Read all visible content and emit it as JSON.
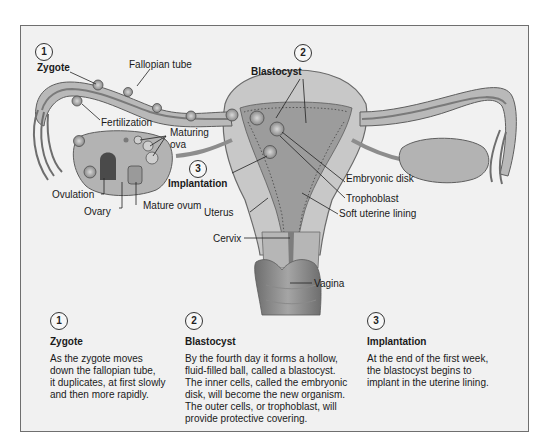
{
  "diagram": {
    "labels": {
      "zygote": "Zygote",
      "fallopian_tube": "Fallopian tube",
      "blastocyst": "Blastocyst",
      "fertilization": "Fertilization",
      "maturing_ova": "Maturing\nova",
      "maturing": "Maturing",
      "ova": "ova",
      "implantation": "Implantation",
      "embryonic_disk": "Embryonic disk",
      "trophoblast": "Trophoblast",
      "soft_uterine_lining": "Soft uterine lining",
      "ovulation": "Ovulation",
      "ovary": "Ovary",
      "mature_ovum": "Mature ovum",
      "uterus": "Uterus",
      "cervix": "Cervix",
      "vagina": "Vagina"
    },
    "stage_markers": [
      "1",
      "2",
      "3"
    ],
    "colors": {
      "frame_bg": "#f1f1f1",
      "frame_border": "#6f6f6f",
      "tissue_light": "#c9c9c9",
      "tissue_mid": "#a9a9a9",
      "tissue_dark": "#7a7a7a",
      "text": "#1a1a1a"
    }
  },
  "stages": [
    {
      "number": "1",
      "title": "Zygote",
      "body": "As the zygote moves\ndown the fallopian tube,\nit duplicates, at first slowly\nand then more rapidly."
    },
    {
      "number": "2",
      "title": "Blastocyst",
      "body": "By the fourth day it forms a hollow,\nfluid-filled ball, called a blastocyst.\nThe inner cells, called the embryonic\ndisk, will become the new organism.\nThe outer cells, or trophoblast, will\nprovide protective covering."
    },
    {
      "number": "3",
      "title": "Implantation",
      "body": "At the end of the first week,\nthe blastocyst begins to\nimplant in the uterine lining."
    }
  ]
}
